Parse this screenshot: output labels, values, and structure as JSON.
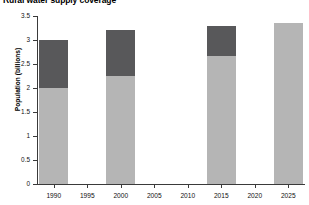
{
  "chart_data": {
    "type": "bar",
    "title": "Rural water supply coverage",
    "xlabel": "",
    "ylabel": "Population (billions)",
    "stacked": true,
    "grid": false,
    "legend": "none",
    "categories": [
      "1990",
      "1995",
      "2000",
      "2005",
      "2010",
      "2015",
      "2020",
      "2025"
    ],
    "xlim": [
      1987.5,
      2027.5
    ],
    "ylim": [
      0,
      3.5
    ],
    "yticks": [
      "0",
      "0.5",
      "1",
      "1.5",
      "2",
      "2.5",
      "3",
      "3.5"
    ],
    "ytick_values": [
      0,
      0.5,
      1,
      1.5,
      2,
      2.5,
      3,
      3.5
    ],
    "series": [
      {
        "name": "Served population",
        "color": "#b5b5b5",
        "values": [
          2.0,
          null,
          2.25,
          null,
          null,
          2.67,
          null,
          3.35
        ]
      },
      {
        "name": "Unserved population",
        "color": "#58585a",
        "values": [
          1.0,
          null,
          0.95,
          null,
          null,
          0.63,
          null,
          0.0
        ]
      }
    ],
    "totals": [
      3.0,
      null,
      3.2,
      null,
      null,
      3.3,
      null,
      3.35
    ],
    "bars": [
      {
        "category": "1990",
        "lower": 2.0,
        "upper": 3.0
      },
      {
        "category": "2000",
        "lower": 2.25,
        "upper": 3.2
      },
      {
        "category": "2015",
        "lower": 2.67,
        "upper": 3.3
      },
      {
        "category": "2025",
        "lower": 3.35,
        "upper": 3.35
      }
    ],
    "colors": {
      "lower_segment": "#b5b5b5",
      "upper_segment": "#58585a",
      "axis": "#3a3a3a",
      "text": "#111111",
      "background": "#ffffff"
    }
  }
}
